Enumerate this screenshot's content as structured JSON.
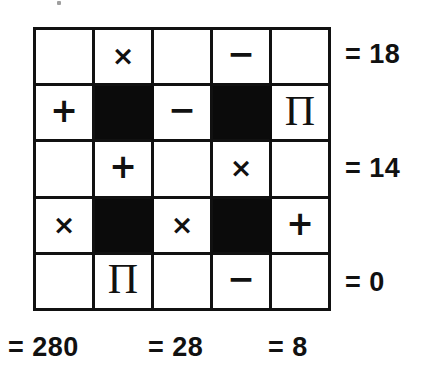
{
  "puzzle": {
    "type": "arithmetic-operator-grid",
    "grid": {
      "rows": 5,
      "columns": 5,
      "cells": [
        [
          {
            "kind": "blank",
            "symbol": ""
          },
          {
            "kind": "operator",
            "symbol": "×",
            "name": "multiply"
          },
          {
            "kind": "blank",
            "symbol": ""
          },
          {
            "kind": "operator",
            "symbol": "−",
            "name": "minus"
          },
          {
            "kind": "blank",
            "symbol": ""
          }
        ],
        [
          {
            "kind": "operator",
            "symbol": "+",
            "name": "plus"
          },
          {
            "kind": "blocked",
            "symbol": ""
          },
          {
            "kind": "operator",
            "symbol": "−",
            "name": "minus"
          },
          {
            "kind": "blocked",
            "symbol": ""
          },
          {
            "kind": "operator",
            "symbol": "Π",
            "name": "product"
          }
        ],
        [
          {
            "kind": "blank",
            "symbol": ""
          },
          {
            "kind": "operator",
            "symbol": "+",
            "name": "plus"
          },
          {
            "kind": "blank",
            "symbol": ""
          },
          {
            "kind": "operator",
            "symbol": "×",
            "name": "multiply"
          },
          {
            "kind": "blank",
            "symbol": ""
          }
        ],
        [
          {
            "kind": "operator",
            "symbol": "×",
            "name": "multiply"
          },
          {
            "kind": "blocked",
            "symbol": ""
          },
          {
            "kind": "operator",
            "symbol": "×",
            "name": "multiply"
          },
          {
            "kind": "blocked",
            "symbol": ""
          },
          {
            "kind": "operator",
            "symbol": "+",
            "name": "plus"
          }
        ],
        [
          {
            "kind": "blank",
            "symbol": ""
          },
          {
            "kind": "operator",
            "symbol": "Π",
            "name": "product"
          },
          {
            "kind": "blank",
            "symbol": ""
          },
          {
            "kind": "operator",
            "symbol": "−",
            "name": "minus"
          },
          {
            "kind": "blank",
            "symbol": ""
          }
        ]
      ]
    },
    "row_results": [
      {
        "label": "= 18",
        "value": 18
      },
      {
        "label": "= 14",
        "value": 14
      },
      {
        "label": "= 0",
        "value": 0
      }
    ],
    "column_results": [
      {
        "label": "= 280",
        "value": 280
      },
      {
        "label": "= 28",
        "value": 28
      },
      {
        "label": "= 8",
        "value": 8
      }
    ],
    "colors": {
      "ink": "#111111",
      "blocked": "#0b0b0b",
      "paper": "#ffffff"
    }
  }
}
